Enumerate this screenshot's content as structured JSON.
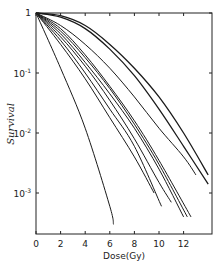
{
  "chart_data": {
    "type": "line",
    "title": "",
    "xlabel": "Dose(Gy)",
    "ylabel": "Survival",
    "xlim": [
      0,
      14
    ],
    "ylim": [
      0.0002,
      1
    ],
    "yscale": "log",
    "grid": false,
    "legend": null,
    "x_ticks": [
      "0",
      "2",
      "4",
      "6",
      "8",
      "10",
      "12"
    ],
    "y_ticks": [
      {
        "value": 1,
        "label": "1"
      },
      {
        "value": 0.1,
        "label": "10^-1"
      },
      {
        "value": 0.01,
        "label": "10^-2"
      },
      {
        "value": 0.001,
        "label": "10^-3"
      }
    ],
    "series": [
      {
        "name": "curve-1",
        "x": [
          0,
          2,
          4,
          6,
          6.3
        ],
        "y": [
          1,
          0.12,
          0.012,
          0.0006,
          0.0003
        ]
      },
      {
        "name": "curve-2",
        "x": [
          0,
          2,
          4,
          6,
          8,
          9.6
        ],
        "y": [
          1,
          0.3,
          0.08,
          0.018,
          0.004,
          0.001
        ]
      },
      {
        "name": "curve-3",
        "x": [
          0,
          2,
          4,
          6,
          8,
          10.2
        ],
        "y": [
          1,
          0.35,
          0.1,
          0.025,
          0.006,
          0.0006
        ]
      },
      {
        "name": "curve-4",
        "x": [
          0,
          2,
          4,
          6,
          8,
          10,
          11.0
        ],
        "y": [
          1,
          0.4,
          0.13,
          0.035,
          0.008,
          0.0015,
          0.0007
        ]
      },
      {
        "name": "curve-5",
        "x": [
          0,
          2,
          4,
          6,
          8,
          10,
          12.0
        ],
        "y": [
          1,
          0.45,
          0.15,
          0.045,
          0.012,
          0.0025,
          0.0004
        ]
      },
      {
        "name": "curve-6",
        "x": [
          0,
          2,
          4,
          6,
          8,
          10,
          12.3
        ],
        "y": [
          1,
          0.5,
          0.18,
          0.055,
          0.014,
          0.003,
          0.0004
        ]
      },
      {
        "name": "curve-7",
        "x": [
          0,
          2,
          4,
          6,
          8,
          10,
          12.6
        ],
        "y": [
          1,
          0.55,
          0.2,
          0.06,
          0.016,
          0.0035,
          0.0004
        ]
      },
      {
        "name": "curve-8",
        "x": [
          0,
          2,
          4,
          6,
          8,
          10,
          12,
          13.0
        ],
        "y": [
          1,
          0.62,
          0.3,
          0.12,
          0.04,
          0.012,
          0.004,
          0.002
        ]
      },
      {
        "name": "curve-9",
        "x": [
          0,
          2,
          4,
          6,
          8,
          10,
          12,
          14.0
        ],
        "y": [
          1,
          0.85,
          0.55,
          0.25,
          0.09,
          0.025,
          0.006,
          0.0014
        ]
      },
      {
        "name": "curve-10",
        "x": [
          0,
          2,
          4,
          6,
          8,
          10,
          12,
          14.0
        ],
        "y": [
          1,
          0.9,
          0.62,
          0.3,
          0.12,
          0.04,
          0.01,
          0.002
        ]
      }
    ]
  }
}
